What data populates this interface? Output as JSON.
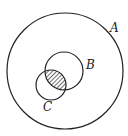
{
  "diagram": {
    "type": "venn",
    "sets": [
      {
        "id": "A",
        "label": "A"
      },
      {
        "id": "B",
        "label": "B"
      },
      {
        "id": "C",
        "label": "C"
      }
    ],
    "shaded_region": "B ∩ C",
    "colors": {
      "stroke": "#222222",
      "hatch": "#222222",
      "background": "#ffffff"
    }
  }
}
